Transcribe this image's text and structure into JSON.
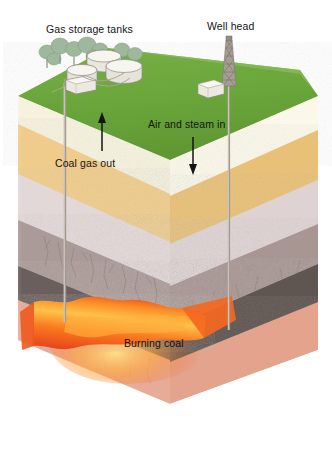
{
  "figure": {
    "background_color": "#ffffff"
  },
  "labels": {
    "gas_storage_tanks": "Gas storage tanks",
    "well_head": "Well head",
    "air_and_steam_in": "Air and steam in",
    "coal_gas_out": "Coal gas out",
    "burning_coal": "Burning coal"
  },
  "surface": {
    "grass_color": "#6aa63c",
    "grass_shadow_color": "#4e8a2c",
    "tree_color": "#9cb79a",
    "tree_trunk_color": "#8a9a86",
    "tank_color": "#efeee8",
    "tank_outline": "#8d8d84",
    "building_color": "#eceae2",
    "derrick_color": "#8a837a"
  },
  "strata": [
    {
      "name": "topsoil-grass",
      "color": "#6aa63c",
      "side_color": "#54902f"
    },
    {
      "name": "cream-sandstone",
      "color": "#f7f3df",
      "side_color": "#e9e4c9"
    },
    {
      "name": "golden-sandstone",
      "color": "#e8bf72",
      "side_color": "#f0cf8e"
    },
    {
      "name": "pale-lavender-shale",
      "color": "#e5dcdb",
      "side_color": "#d6cdcd"
    },
    {
      "name": "grey-brown-mudstone",
      "color": "#b4a5a2",
      "side_color": "#9d8d8c"
    },
    {
      "name": "dark-grey-rock",
      "color": "#6e625f",
      "side_color": "#5c5250"
    },
    {
      "name": "burning-coal-seam",
      "color": "#f26522",
      "side_color": "#f58220"
    },
    {
      "name": "salmon-basement",
      "color": "#e9b09b",
      "side_color": "#dc9e89"
    }
  ],
  "boreholes": {
    "production_well": {
      "name": "coal-gas-out-borehole",
      "color": "#9a9086"
    },
    "injection_well": {
      "name": "air-steam-in-borehole",
      "color": "#9a9086"
    }
  },
  "arrows": {
    "up_arrow": {
      "name": "coal-gas-out-arrow",
      "direction": "up",
      "color": "#141414"
    },
    "down_arrow": {
      "name": "air-steam-in-arrow",
      "direction": "down",
      "color": "#141414"
    }
  }
}
